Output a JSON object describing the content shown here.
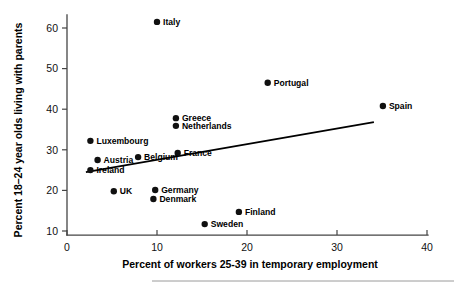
{
  "chart_data": {
    "type": "scatter",
    "title": "",
    "xlabel": "Percent of workers 25-39 in temporary employment",
    "ylabel": "Percent 18–24 year olds living with parents",
    "xlim": [
      0,
      40
    ],
    "ylim": [
      9,
      63
    ],
    "grid": false,
    "legend": "none",
    "xticks": [
      0,
      10,
      20,
      30,
      40
    ],
    "yticks": [
      10,
      20,
      30,
      40,
      50,
      60
    ],
    "xtick_labels": [
      "0",
      "10",
      "20",
      "30",
      "40"
    ],
    "ytick_labels": [
      "10",
      "20",
      "30",
      "40",
      "50",
      "60"
    ],
    "marker_color": "#101010",
    "trend_color": "#000000",
    "axis_color": "#444444",
    "points": [
      {
        "label": "Italy",
        "x": 10.0,
        "y": 61.5,
        "label_side": "right"
      },
      {
        "label": "Portugal",
        "x": 22.3,
        "y": 46.5,
        "label_side": "right"
      },
      {
        "label": "Spain",
        "x": 35.1,
        "y": 40.8,
        "label_side": "right"
      },
      {
        "label": "Greece",
        "x": 12.1,
        "y": 37.8,
        "label_side": "right"
      },
      {
        "label": "Netherlands",
        "x": 12.1,
        "y": 35.9,
        "label_side": "right"
      },
      {
        "label": "Luxembourg",
        "x": 2.6,
        "y": 32.2,
        "label_side": "right"
      },
      {
        "label": "France",
        "x": 12.3,
        "y": 29.2,
        "label_side": "right"
      },
      {
        "label": "Belgium",
        "x": 7.9,
        "y": 28.2,
        "label_side": "right"
      },
      {
        "label": "Austria",
        "x": 3.4,
        "y": 27.5,
        "label_side": "right"
      },
      {
        "label": "Ireland",
        "x": 2.6,
        "y": 25.0,
        "label_side": "right"
      },
      {
        "label": "Germany",
        "x": 9.8,
        "y": 20.1,
        "label_side": "right"
      },
      {
        "label": "UK",
        "x": 5.2,
        "y": 19.8,
        "label_side": "right"
      },
      {
        "label": "Denmark",
        "x": 9.6,
        "y": 17.9,
        "label_side": "right-below"
      },
      {
        "label": "Finland",
        "x": 19.1,
        "y": 14.7,
        "label_side": "right"
      },
      {
        "label": "Sweden",
        "x": 15.3,
        "y": 11.7,
        "label_side": "right"
      }
    ],
    "trend_line": {
      "x_start": 2.1,
      "y_start": 24.5,
      "x_end": 34.1,
      "y_end": 36.8
    }
  }
}
